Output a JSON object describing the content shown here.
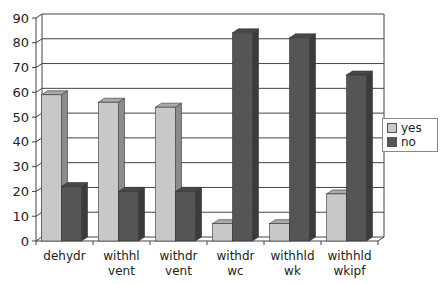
{
  "chart_data": {
    "type": "bar",
    "style": "3d-clustered-column",
    "title": "",
    "xlabel": "",
    "ylabel": "",
    "ylim": [
      0,
      90
    ],
    "yticks": [
      0,
      10,
      20,
      30,
      40,
      50,
      60,
      70,
      80,
      90
    ],
    "grid": true,
    "legend_position": "right",
    "categories": [
      [
        "dehydr"
      ],
      [
        "withhl",
        "vent"
      ],
      [
        "withdr",
        "vent"
      ],
      [
        "withdr",
        "wc"
      ],
      [
        "withhld",
        "wk"
      ],
      [
        "withhld",
        "wkipf"
      ]
    ],
    "series": [
      {
        "name": "yes",
        "color": "#c8c8c8",
        "values": [
          59,
          56,
          54,
          7,
          7,
          19
        ]
      },
      {
        "name": "no",
        "color": "#555555",
        "values": [
          22,
          20,
          20,
          84,
          82,
          67
        ]
      }
    ]
  },
  "legend": {
    "items": [
      {
        "label": "yes",
        "color": "#c8c8c8"
      },
      {
        "label": "no",
        "color": "#555555"
      }
    ]
  }
}
